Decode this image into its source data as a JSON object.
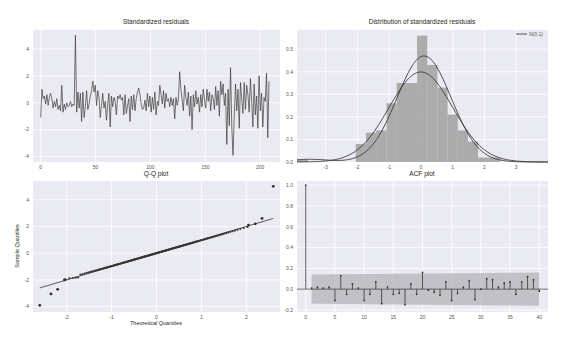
{
  "figure": {
    "background": "#ffffff",
    "axes_background": "#eaeaf2",
    "grid_color": "#ffffff",
    "line_color": "#3b3b3b",
    "hist_color": "#a0a0a0",
    "band_color": "#b3b3b8"
  },
  "chart_data": [
    {
      "id": "residuals",
      "type": "line",
      "title": "Standardized residuals",
      "xlabel": "",
      "ylabel": "",
      "xlim": [
        -7,
        218
      ],
      "ylim": [
        -4.4,
        5.4
      ],
      "xticks": [
        0,
        50,
        100,
        150,
        200
      ],
      "yticks": [
        -4,
        -2,
        0,
        2,
        4
      ],
      "grid": true,
      "series": [
        {
          "name": "residuals",
          "y": [
            -1.1,
            1.0,
            0.3,
            0.5,
            -0.1,
            0.6,
            -0.2,
            0.4,
            0.7,
            0.3,
            -0.4,
            0.1,
            -0.3,
            0.3,
            -0.5,
            -0.2,
            -0.6,
            1.3,
            -0.7,
            -0.1,
            -0.5,
            0.0,
            -0.3,
            -0.2,
            0.1,
            -0.3,
            -0.1,
            -0.2,
            5.0,
            -0.7,
            0.8,
            -0.4,
            0.7,
            -1.4,
            0.8,
            -1.1,
            -0.3,
            0.9,
            -0.5,
            -0.1,
            0.5,
            0.9,
            1.6,
            0.8,
            1.3,
            -0.2,
            0.9,
            0.4,
            -1.1,
            -0.2,
            0.7,
            -0.4,
            0.1,
            -1.3,
            -0.1,
            0.7,
            -1.8,
            0.5,
            -0.3,
            0.4,
            0.1,
            -0.9,
            0.5,
            0.3,
            0.6,
            0.2,
            0.4,
            -0.9,
            0.6,
            -0.8,
            -0.2,
            0.3,
            -1.4,
            0.5,
            -0.5,
            0.6,
            -0.6,
            0.3,
            0.8,
            1.1,
            0.6,
            -0.1,
            -0.5,
            -0.4,
            0.2,
            -0.6,
            0.7,
            -0.3,
            0.5,
            -0.7,
            0.4,
            -0.5,
            0.8,
            -0.9,
            0.1,
            -0.2,
            1.3,
            0.6,
            -0.1,
            0.9,
            -0.4,
            0.7,
            0.1,
            0.3,
            -0.3,
            0.4,
            -0.2,
            0.3,
            -1.2,
            0.4,
            -0.2,
            0.3,
            2.3,
            1.0,
            0.2,
            -0.6,
            1.3,
            0.4,
            -0.2,
            0.8,
            -1.0,
            0.5,
            -2.0,
            0.6,
            -0.3,
            0.9,
            -0.1,
            0.4,
            -0.7,
            0.6,
            -0.3,
            1.0,
            0.2,
            -0.4,
            1.0,
            0.1,
            0.8,
            -0.6,
            0.6,
            0.3,
            -0.5,
            1.2,
            -0.2,
            0.9,
            -1.0,
            1.6,
            0.6,
            1.4,
            -0.2,
            0.7,
            -3.1,
            1.0,
            -1.7,
            2.6,
            -1.8,
            -3.9,
            -0.9,
            1.4,
            -0.6,
            1.0,
            -1.9,
            1.5,
            0.3,
            -0.8,
            1.5,
            -0.5,
            1.3,
            0.6,
            -0.7,
            1.8,
            0.2,
            -1.8,
            1.4,
            -0.9,
            0.5,
            -1.9,
            2.0,
            -0.6,
            0.7,
            -1.8,
            0.4,
            0.1,
            2.2,
            -2.6,
            1.6
          ]
        }
      ]
    },
    {
      "id": "distribution",
      "type": "bar",
      "title": "Distribution of standardized residuals",
      "xlim": [
        -3.9,
        4.0
      ],
      "ylim": [
        0,
        0.585
      ],
      "xticks": [
        -3,
        -2,
        -1,
        0,
        1,
        2,
        3
      ],
      "yticks": [
        0.0,
        0.1,
        0.2,
        0.3,
        0.4,
        0.5
      ],
      "ytick_labels": [
        "0.0",
        "0.1",
        "0.2",
        "0.3",
        "0.4",
        "0.5"
      ],
      "grid": true,
      "legend": {
        "position": "upper right",
        "entries": [
          "N(0,1)"
        ]
      },
      "histogram": {
        "bins": [
          {
            "x0": -3.9,
            "x1": -3.55,
            "height": 0.01
          },
          {
            "x0": -2.05,
            "x1": -1.73,
            "height": 0.08
          },
          {
            "x0": -1.73,
            "x1": -1.41,
            "height": 0.13
          },
          {
            "x0": -1.41,
            "x1": -1.08,
            "height": 0.14
          },
          {
            "x0": -1.08,
            "x1": -0.76,
            "height": 0.26
          },
          {
            "x0": -0.76,
            "x1": -0.44,
            "height": 0.35
          },
          {
            "x0": -0.44,
            "x1": -0.12,
            "height": 0.35
          },
          {
            "x0": -0.12,
            "x1": 0.2,
            "height": 0.56
          },
          {
            "x0": 0.2,
            "x1": 0.52,
            "height": 0.43
          },
          {
            "x0": 0.52,
            "x1": 0.84,
            "height": 0.33
          },
          {
            "x0": 0.84,
            "x1": 1.16,
            "height": 0.21
          },
          {
            "x0": 1.16,
            "x1": 1.48,
            "height": 0.14
          },
          {
            "x0": 1.48,
            "x1": 1.8,
            "height": 0.09
          },
          {
            "x0": 1.8,
            "x1": 2.5,
            "height": 0.02
          }
        ]
      },
      "series": [
        {
          "name": "KDE",
          "kind": "kde",
          "mean": 0.1,
          "sd": 0.85,
          "peak": 0.47,
          "tail_left": 0.012
        },
        {
          "name": "N(0,1)",
          "kind": "normal",
          "mean": 0.0,
          "sd": 1.0
        }
      ]
    },
    {
      "id": "qq",
      "type": "scatter",
      "title": "Q-Q plot",
      "xlabel": "Theoretical Quantiles",
      "ylabel": "Sample Quantiles",
      "xlim": [
        -2.75,
        2.75
      ],
      "ylim": [
        -4.4,
        5.4
      ],
      "xticks": [
        -2,
        -1,
        0,
        1,
        2
      ],
      "yticks": [
        -4,
        -2,
        0,
        2,
        4
      ],
      "grid": true,
      "reference_line": {
        "x": [
          -2.6,
          2.6
        ],
        "y": [
          -2.6,
          2.6
        ]
      },
      "outliers": [
        {
          "x": -2.6,
          "y": -3.9
        },
        {
          "x": -2.35,
          "y": -3.05
        },
        {
          "x": -2.2,
          "y": -2.7
        },
        {
          "x": -2.05,
          "y": -2.0
        },
        {
          "x": 2.05,
          "y": 2.1
        },
        {
          "x": 2.2,
          "y": 2.2
        },
        {
          "x": 2.35,
          "y": 2.6
        },
        {
          "x": 2.6,
          "y": 5.0
        }
      ],
      "n_points": 210
    },
    {
      "id": "acf",
      "type": "bar",
      "title": "ACF plot",
      "xlim": [
        -1.5,
        41.5
      ],
      "ylim": [
        -0.22,
        1.04
      ],
      "xticks": [
        0,
        5,
        10,
        15,
        20,
        25,
        30,
        35,
        40
      ],
      "yticks": [
        -0.2,
        0.0,
        0.2,
        0.4,
        0.6,
        0.8,
        1.0
      ],
      "ytick_labels": [
        "-0.2",
        "0.0",
        "0.2",
        "0.4",
        "0.6",
        "0.8",
        "1.0"
      ],
      "grid": true,
      "confidence_band": {
        "x0": 1,
        "x1": 40,
        "lower_start": -0.14,
        "upper_start": 0.14,
        "lower_end": -0.16,
        "upper_end": 0.16
      },
      "lags": [
        0,
        1,
        2,
        3,
        4,
        5,
        6,
        7,
        8,
        9,
        10,
        11,
        12,
        13,
        14,
        15,
        16,
        17,
        18,
        19,
        20,
        21,
        22,
        23,
        24,
        25,
        26,
        27,
        28,
        29,
        30,
        31,
        32,
        33,
        34,
        35,
        36,
        37,
        38,
        39,
        40
      ],
      "values": [
        1.0,
        0.01,
        0.02,
        0.01,
        0.02,
        -0.11,
        0.13,
        -0.05,
        0.05,
        0.01,
        -0.11,
        -0.05,
        0.07,
        -0.14,
        0.02,
        -0.05,
        -0.04,
        -0.15,
        0.05,
        -0.05,
        0.16,
        -0.01,
        -0.03,
        -0.06,
        0.07,
        -0.11,
        -0.04,
        0.02,
        0.08,
        -0.1,
        0.0,
        0.1,
        0.09,
        0.02,
        0.06,
        0.07,
        -0.05,
        0.07,
        0.12,
        0.09,
        -0.02
      ]
    }
  ]
}
